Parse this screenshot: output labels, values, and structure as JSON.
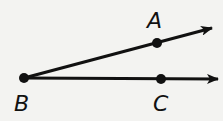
{
  "diagram": {
    "type": "angle",
    "vertex": {
      "label": "B",
      "x": 24,
      "y": 78
    },
    "rays": [
      {
        "name": "ray-BA",
        "from": "B",
        "through": "A",
        "tip": {
          "x": 214,
          "y": 27
        }
      },
      {
        "name": "ray-BC",
        "from": "B",
        "through": "C",
        "tip": {
          "x": 220,
          "y": 79
        }
      }
    ],
    "points": [
      {
        "label": "A",
        "x": 157,
        "y": 43,
        "label_x": 148,
        "label_y": 28
      },
      {
        "label": "B",
        "x": 24,
        "y": 78,
        "label_x": 15,
        "label_y": 111
      },
      {
        "label": "C",
        "x": 161,
        "y": 79,
        "label_x": 154,
        "label_y": 111
      }
    ],
    "colors": {
      "stroke": "#111111",
      "background": "#f3f3f1"
    }
  }
}
